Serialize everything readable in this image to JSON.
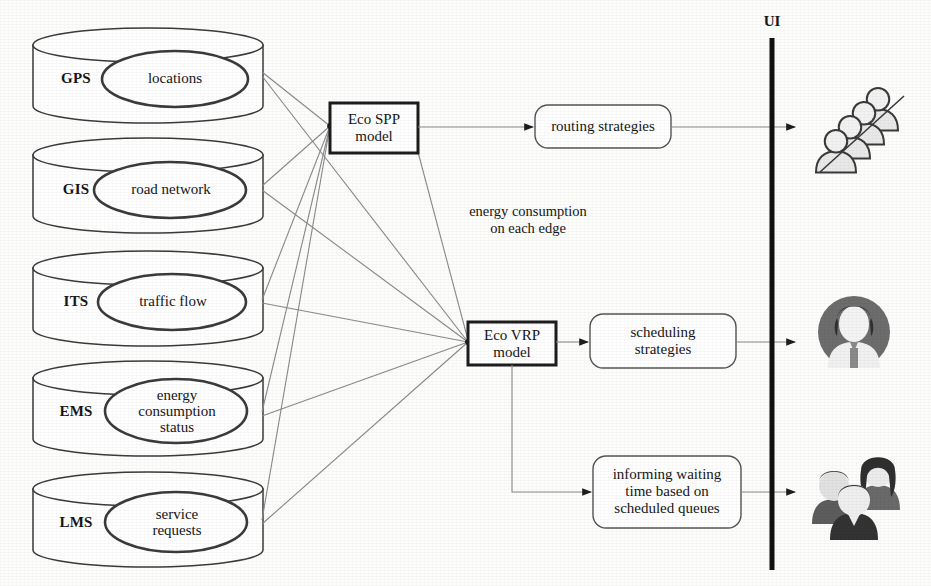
{
  "diagram": {
    "ui_label": "UI",
    "edge_annotation": "energy consumption\non each edge",
    "colors": {
      "stroke": "#2b2b2b",
      "thin_line": "#8d8d8d",
      "fill": "#ffffff",
      "icon_dark": "#3a3a3a",
      "icon_mid": "#9b9b9b",
      "icon_light": "#dcdcdc",
      "background": "#fdfdfc"
    },
    "databases": [
      {
        "tag": "GPS",
        "content": "locations"
      },
      {
        "tag": "GIS",
        "content": "road network"
      },
      {
        "tag": "ITS",
        "content": "traffic flow"
      },
      {
        "tag": "EMS",
        "content": "energy\nconsumption\nstatus"
      },
      {
        "tag": "LMS",
        "content": "service\nrequests"
      }
    ],
    "models": [
      {
        "name": "eco-spp",
        "label": "Eco SPP\nmodel"
      },
      {
        "name": "eco-vrp",
        "label": "Eco VRP\nmodel"
      }
    ],
    "outputs": [
      {
        "name": "routing-strategies",
        "label": "routing strategies"
      },
      {
        "name": "scheduling-strategies",
        "label": "scheduling\nstrategies"
      },
      {
        "name": "waiting-time",
        "label": "informing waiting\ntime based on\nscheduled queues"
      }
    ],
    "actors": [
      {
        "name": "drivers-group-icon",
        "description": "group of drivers"
      },
      {
        "name": "operator-avatar-icon",
        "description": "single operator avatar"
      },
      {
        "name": "customers-group-icon",
        "description": "group of customers"
      }
    ]
  }
}
